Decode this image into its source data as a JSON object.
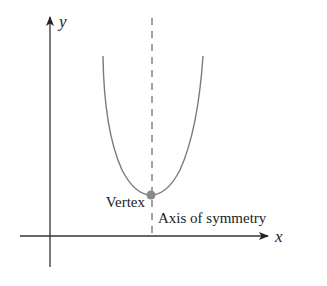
{
  "diagram": {
    "type": "parabola-graph",
    "axes": {
      "x_label": "x",
      "y_label": "y"
    },
    "labels": {
      "vertex": "Vertex",
      "axis_of_symmetry": "Axis of symmetry"
    },
    "colors": {
      "axis": "#333333",
      "curve": "#7a7a7a",
      "symmetry_line": "#555555",
      "vertex_dot": "#888888",
      "text": "#222222"
    },
    "geometry": {
      "origin": [
        50,
        236
      ],
      "vertex": [
        151,
        195
      ],
      "curve_top_left": [
        103,
        56
      ],
      "curve_top_right": [
        203,
        56
      ],
      "symmetry_x": 152
    }
  }
}
